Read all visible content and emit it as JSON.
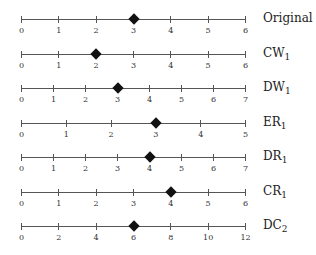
{
  "chart_data": {
    "type": "scatter",
    "title": "",
    "series": [
      {
        "name": "Original",
        "base": "Original",
        "sub": "",
        "min": 0,
        "max": 6,
        "ticks": [
          0,
          1,
          2,
          3,
          4,
          5,
          6
        ],
        "value": 3
      },
      {
        "name": "CW1",
        "base": "CW",
        "sub": "1",
        "min": 0,
        "max": 6,
        "ticks": [
          0,
          1,
          2,
          3,
          4,
          5,
          6
        ],
        "value": 2
      },
      {
        "name": "DW1",
        "base": "DW",
        "sub": "1",
        "min": 0,
        "max": 7,
        "ticks": [
          0,
          1,
          2,
          3,
          4,
          5,
          6,
          7
        ],
        "value": 3
      },
      {
        "name": "ER1",
        "base": "ER",
        "sub": "1",
        "min": 0,
        "max": 5,
        "ticks": [
          0,
          1,
          2,
          3,
          4,
          5
        ],
        "value": 3
      },
      {
        "name": "DR1",
        "base": "DR",
        "sub": "1",
        "min": 0,
        "max": 7,
        "ticks": [
          0,
          1,
          2,
          3,
          4,
          5,
          6,
          7
        ],
        "value": 4
      },
      {
        "name": "CR1",
        "base": "CR",
        "sub": "1",
        "min": 0,
        "max": 6,
        "ticks": [
          0,
          1,
          2,
          3,
          4,
          5,
          6
        ],
        "value": 4
      },
      {
        "name": "DC2",
        "base": "DC",
        "sub": "2",
        "min": 0,
        "max": 12,
        "ticks": [
          0,
          2,
          4,
          6,
          8,
          10,
          12
        ],
        "value": 6
      }
    ],
    "xlabel": "",
    "ylabel": "",
    "grid": false,
    "marker": "diamond",
    "marker_color": "#111111",
    "axis_color": "#555555"
  }
}
